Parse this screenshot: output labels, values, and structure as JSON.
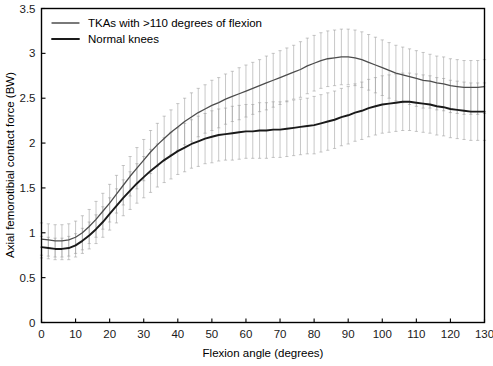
{
  "chart_data": {
    "type": "line",
    "title": "",
    "xlabel": "Flexion angle (degrees)",
    "ylabel": "Axial femorotibial contact force (BW)",
    "xlim": [
      0,
      130
    ],
    "ylim": [
      0,
      3.5
    ],
    "xticks": [
      0,
      10,
      20,
      30,
      40,
      50,
      60,
      70,
      80,
      90,
      100,
      110,
      120,
      130
    ],
    "yticks": [
      0,
      0.5,
      1,
      1.5,
      2,
      2.5,
      3,
      3.5
    ],
    "xtick_labels": [
      "0",
      "10",
      "20",
      "30",
      "40",
      "50",
      "60",
      "70",
      "80",
      "90",
      "100",
      "110",
      "120",
      "130"
    ],
    "ytick_labels": [
      "0",
      "0.5",
      "1",
      "1.5",
      "2",
      "2.5",
      "3",
      "3.5"
    ],
    "grid": false,
    "legend_position": "top-left",
    "error_bars": "vertical, +/- 1 SD, light gray",
    "x": [
      0,
      2,
      4,
      6,
      8,
      10,
      12,
      14,
      16,
      18,
      20,
      22,
      24,
      26,
      28,
      30,
      32,
      34,
      36,
      38,
      40,
      42,
      44,
      46,
      48,
      50,
      52,
      54,
      56,
      58,
      60,
      62,
      64,
      66,
      68,
      70,
      72,
      74,
      76,
      78,
      80,
      82,
      84,
      86,
      88,
      90,
      92,
      94,
      96,
      98,
      100,
      102,
      104,
      106,
      108,
      110,
      112,
      114,
      116,
      118,
      120,
      122,
      124,
      126,
      128,
      130
    ],
    "series": [
      {
        "name": "TKAs with >110 degrees of flexion",
        "color": "#4d4d4d",
        "linewidth": 1.3,
        "values": [
          0.93,
          0.92,
          0.91,
          0.91,
          0.92,
          0.95,
          1.0,
          1.07,
          1.15,
          1.24,
          1.33,
          1.43,
          1.53,
          1.63,
          1.72,
          1.81,
          1.9,
          1.98,
          2.05,
          2.12,
          2.18,
          2.24,
          2.29,
          2.34,
          2.38,
          2.42,
          2.45,
          2.49,
          2.52,
          2.55,
          2.58,
          2.61,
          2.64,
          2.67,
          2.7,
          2.73,
          2.76,
          2.79,
          2.82,
          2.86,
          2.89,
          2.92,
          2.94,
          2.95,
          2.96,
          2.96,
          2.95,
          2.93,
          2.9,
          2.87,
          2.84,
          2.81,
          2.78,
          2.76,
          2.74,
          2.72,
          2.7,
          2.69,
          2.67,
          2.66,
          2.64,
          2.63,
          2.62,
          2.62,
          2.62,
          2.63
        ],
        "err": [
          0.18,
          0.18,
          0.18,
          0.18,
          0.18,
          0.18,
          0.19,
          0.19,
          0.2,
          0.2,
          0.21,
          0.21,
          0.22,
          0.22,
          0.23,
          0.23,
          0.24,
          0.24,
          0.25,
          0.25,
          0.26,
          0.26,
          0.27,
          0.27,
          0.27,
          0.28,
          0.28,
          0.28,
          0.28,
          0.29,
          0.29,
          0.29,
          0.29,
          0.3,
          0.3,
          0.3,
          0.3,
          0.3,
          0.31,
          0.31,
          0.31,
          0.31,
          0.31,
          0.31,
          0.31,
          0.31,
          0.31,
          0.31,
          0.31,
          0.31,
          0.31,
          0.31,
          0.31,
          0.31,
          0.31,
          0.31,
          0.31,
          0.3,
          0.3,
          0.3,
          0.3,
          0.3,
          0.3,
          0.3,
          0.3,
          0.3
        ]
      },
      {
        "name": "Normal knees",
        "color": "#1a1a1a",
        "linewidth": 1.9,
        "values": [
          0.84,
          0.83,
          0.82,
          0.82,
          0.83,
          0.86,
          0.91,
          0.97,
          1.04,
          1.12,
          1.21,
          1.3,
          1.39,
          1.47,
          1.55,
          1.62,
          1.69,
          1.75,
          1.81,
          1.86,
          1.91,
          1.95,
          1.99,
          2.02,
          2.05,
          2.07,
          2.09,
          2.1,
          2.11,
          2.12,
          2.13,
          2.13,
          2.14,
          2.14,
          2.15,
          2.15,
          2.16,
          2.17,
          2.18,
          2.19,
          2.2,
          2.22,
          2.24,
          2.26,
          2.29,
          2.31,
          2.34,
          2.36,
          2.39,
          2.41,
          2.43,
          2.44,
          2.45,
          2.46,
          2.46,
          2.45,
          2.44,
          2.43,
          2.41,
          2.4,
          2.38,
          2.37,
          2.36,
          2.35,
          2.35,
          2.35
        ],
        "err": [
          0.12,
          0.12,
          0.12,
          0.12,
          0.13,
          0.13,
          0.14,
          0.15,
          0.16,
          0.17,
          0.18,
          0.19,
          0.2,
          0.21,
          0.22,
          0.23,
          0.24,
          0.24,
          0.25,
          0.26,
          0.26,
          0.27,
          0.27,
          0.28,
          0.28,
          0.29,
          0.29,
          0.29,
          0.3,
          0.3,
          0.3,
          0.3,
          0.31,
          0.31,
          0.31,
          0.31,
          0.31,
          0.31,
          0.31,
          0.31,
          0.32,
          0.32,
          0.32,
          0.32,
          0.32,
          0.32,
          0.32,
          0.32,
          0.32,
          0.32,
          0.32,
          0.32,
          0.32,
          0.32,
          0.32,
          0.32,
          0.32,
          0.32,
          0.32,
          0.32,
          0.32,
          0.32,
          0.32,
          0.32,
          0.32,
          0.32
        ]
      }
    ]
  },
  "legend": {
    "items": [
      {
        "label": "TKAs with >110 degrees of flexion",
        "color": "#4d4d4d"
      },
      {
        "label": "Normal knees",
        "color": "#1a1a1a"
      }
    ]
  },
  "style": {
    "background": "#ffffff",
    "axis_color": "#000000",
    "errorbar_color": "#9a9a9a"
  }
}
